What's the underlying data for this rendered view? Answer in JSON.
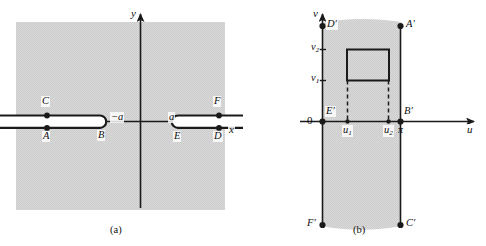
{
  "figure": {
    "panels": [
      {
        "id": "a",
        "caption": "(a)",
        "plane": "z-plane",
        "axes": {
          "x_label": "x",
          "y_label": "y"
        },
        "branch_cuts": [
          {
            "name": "left-slit",
            "endpoint_label": "−a",
            "points": [
              {
                "label": "C",
                "side": "upper"
              },
              {
                "label": "A",
                "side": "lower"
              },
              {
                "label": "B",
                "side": "endpoint"
              }
            ]
          },
          {
            "name": "right-slit",
            "endpoint_label": "a",
            "points": [
              {
                "label": "F",
                "side": "upper"
              },
              {
                "label": "D",
                "side": "lower"
              },
              {
                "label": "E",
                "side": "endpoint"
              }
            ]
          }
        ]
      },
      {
        "id": "b",
        "caption": "(b)",
        "plane": "w-plane",
        "axes": {
          "x_label": "u",
          "y_label": "v",
          "origin_label": "0"
        },
        "u_ticks": [
          {
            "label": "u",
            "sub": "1"
          },
          {
            "label": "u",
            "sub": "2"
          },
          {
            "label": "π",
            "sub": ""
          }
        ],
        "v_ticks": [
          {
            "label": "v",
            "sub": "1"
          },
          {
            "label": "v",
            "sub": "2"
          }
        ],
        "corner_points": [
          {
            "label": "D",
            "prime": "′",
            "pos": "top-left"
          },
          {
            "label": "A",
            "prime": "′",
            "pos": "top-right"
          },
          {
            "label": "E",
            "prime": "′",
            "pos": "origin"
          },
          {
            "label": "B",
            "prime": "′",
            "pos": "mid-right"
          },
          {
            "label": "F",
            "prime": "′",
            "pos": "bottom-left"
          },
          {
            "label": "C",
            "prime": "′",
            "pos": "bottom-right"
          }
        ],
        "inner_rectangle": {
          "u_from": "u1",
          "u_to": "u2",
          "v_from": "v1",
          "v_to": "v2"
        }
      }
    ],
    "colors": {
      "shade": "#d4d4d4",
      "ink": "#1a1a1a",
      "axis": "#2a2a2a"
    },
    "labels": {
      "y_axis": "y",
      "x_axis": "x",
      "v_axis": "v",
      "u_axis": "u",
      "origin": "0",
      "pi": "π",
      "minus_a": "−a",
      "a": "a",
      "A": "A",
      "B": "B",
      "C": "C",
      "D": "D",
      "E": "E",
      "F": "F",
      "Ap": "A",
      "Bp": "B",
      "Cp": "C",
      "Dp": "D",
      "Ep": "E",
      "Fp": "F",
      "prime": "′",
      "v1": "v",
      "v2": "v",
      "u1": "u",
      "u2": "u",
      "one": "1",
      "two": "2",
      "caption_a": "(a)",
      "caption_b": "(b)"
    }
  }
}
